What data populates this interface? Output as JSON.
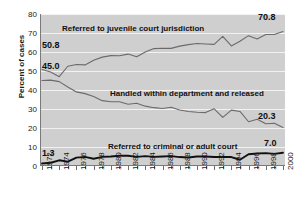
{
  "chart_data": {
    "type": "line",
    "title": "",
    "xlabel": "",
    "ylabel": "Percent of cases",
    "ylim": [
      0,
      80
    ],
    "yticks": [
      0,
      10,
      20,
      30,
      40,
      50,
      60,
      70,
      80
    ],
    "grid": true,
    "legend_position": "in-plot labels",
    "x": [
      1972,
      1973,
      1974,
      1975,
      1976,
      1977,
      1978,
      1979,
      1980,
      1981,
      1982,
      1983,
      1984,
      1985,
      1986,
      1987,
      1988,
      1989,
      1990,
      1991,
      1992,
      1993,
      1994,
      1995,
      1996,
      1997,
      1998,
      1999,
      2000
    ],
    "xtick_labels": [
      "1972",
      "1974",
      "1976",
      "1978",
      "1980",
      "1982",
      "1984",
      "1986",
      "1988",
      "1990",
      "1992",
      "1994",
      "1996",
      "1998",
      "2000"
    ],
    "series": [
      {
        "name": "Referred to juvenile court jurisdiction",
        "values": [
          50.8,
          49.5,
          47.0,
          52.5,
          53.4,
          53.2,
          55.6,
          57.3,
          58.1,
          58.0,
          58.9,
          57.5,
          60.0,
          61.8,
          62.0,
          61.9,
          63.1,
          63.9,
          64.5,
          64.2,
          64.0,
          68.2,
          63.2,
          65.7,
          68.6,
          66.9,
          69.2,
          69.2,
          70.8
        ],
        "start_label": "50.8",
        "end_label": "70.8",
        "color": "#6b6b6b"
      },
      {
        "name": "Handled within department and released",
        "values": [
          45.0,
          45.2,
          44.4,
          41.6,
          39.0,
          38.1,
          36.6,
          34.4,
          33.8,
          33.8,
          32.5,
          33.0,
          31.5,
          30.7,
          30.3,
          30.9,
          29.5,
          28.7,
          28.3,
          28.1,
          30.1,
          25.6,
          29.4,
          28.7,
          23.3,
          24.6,
          22.2,
          22.5,
          20.3
        ],
        "start_label": "45.0",
        "end_label": "20.3",
        "color": "#6b6b6b"
      },
      {
        "name": "Referred to criminal or adult court",
        "values": [
          1.3,
          1.7,
          3.0,
          2.3,
          4.4,
          4.8,
          3.8,
          4.8,
          5.0,
          5.4,
          5.4,
          4.8,
          5.2,
          4.8,
          5.0,
          5.2,
          4.7,
          4.5,
          5.0,
          5.0,
          4.7,
          4.8,
          4.7,
          3.3,
          6.2,
          6.6,
          6.8,
          6.4,
          7.0
        ],
        "start_label": "1.3",
        "end_label": "7.0",
        "color": "#101010"
      }
    ]
  },
  "labels": {
    "ylabel": "Percent of cases",
    "series1_inplot": "Referred to juvenile court jurisdiction",
    "series2_inplot": "Handled within department and released",
    "series3_inplot": "Referred to criminal or adult court",
    "v_50_8": "50.8",
    "v_45_0": "45.0",
    "v_1_3": "1.3",
    "v_70_8": "70.8",
    "v_20_3": "20.3",
    "v_7_0": "7.0"
  },
  "colors": {
    "plot_background": "#cfcfcf",
    "gridline": "#f2f2f2",
    "axis": "#7a7a7a",
    "line_light": "#6b6b6b",
    "line_dark": "#101010",
    "text": "#101010",
    "page_background": "#ffffff"
  }
}
